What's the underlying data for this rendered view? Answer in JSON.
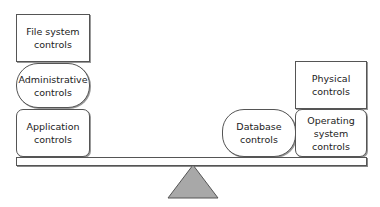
{
  "diagram": {
    "type": "balance-scale",
    "left_stack": [
      {
        "label": "File system controls",
        "shape": "rectangle"
      },
      {
        "label": "Administrative controls",
        "shape": "pill"
      },
      {
        "label": "Application controls",
        "shape": "rounded-rectangle"
      }
    ],
    "right_side": [
      {
        "label": "Database controls",
        "shape": "pill"
      },
      {
        "label": "Physical controls",
        "shape": "rectangle"
      },
      {
        "label": "Operating system controls",
        "shape": "rounded-rectangle"
      }
    ],
    "fulcrum": {
      "shape": "triangle",
      "color": "#a8a8a8"
    }
  }
}
